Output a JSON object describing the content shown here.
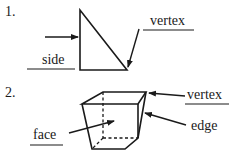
{
  "diagram_1": {
    "number": "1.",
    "shape": "right-triangle",
    "labels": {
      "side": "side",
      "vertex": "vertex"
    }
  },
  "diagram_2": {
    "number": "2.",
    "shape": "prism",
    "labels": {
      "vertex": "vertex",
      "face": "face",
      "edge": "edge"
    }
  },
  "colors": {
    "line": "#1a1a1a",
    "background": "#ffffff"
  }
}
